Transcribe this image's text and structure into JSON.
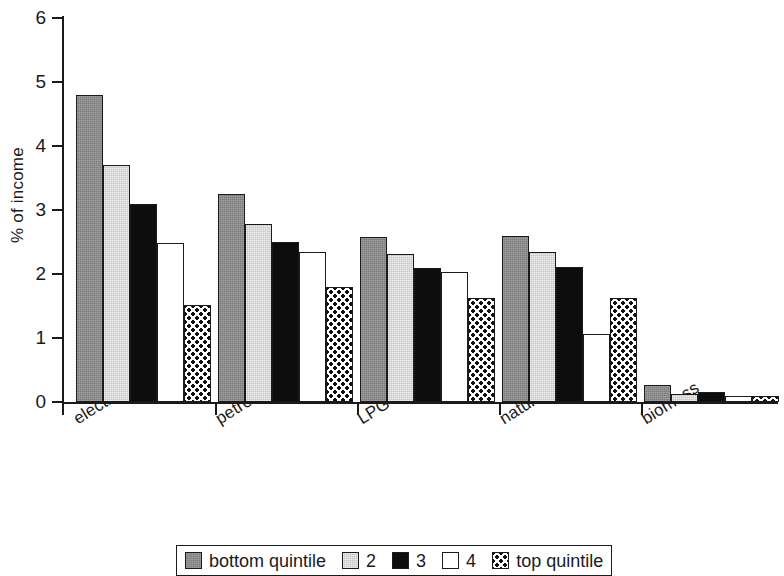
{
  "chart_data": {
    "type": "bar",
    "title": "",
    "xlabel": "",
    "ylabel": "% of income",
    "ylim": [
      0,
      6
    ],
    "ytick_values": [
      0,
      1,
      2,
      3,
      4,
      5,
      6
    ],
    "ytick_labels": [
      "0",
      "1",
      "2",
      "3",
      "4",
      "5",
      "6"
    ],
    "grid": false,
    "legend_position": "bottom",
    "categories": [
      "electricity",
      "petroleum fuels",
      "LPG",
      "natural gas",
      "biomass"
    ],
    "series": [
      {
        "name": "bottom quintile",
        "fill": "darkgray",
        "color": "#8a8a8a",
        "values": [
          4.8,
          3.25,
          2.58,
          2.59,
          0.27
        ]
      },
      {
        "name": "2",
        "fill": "lightgray",
        "color": "#d8d8d8",
        "values": [
          3.7,
          2.78,
          2.32,
          2.34,
          0.12
        ]
      },
      {
        "name": "3",
        "fill": "black",
        "color": "#0d0d0d",
        "values": [
          3.1,
          2.5,
          2.09,
          2.11,
          0.15
        ]
      },
      {
        "name": "4",
        "fill": "white",
        "color": "#ffffff",
        "values": [
          2.48,
          2.34,
          2.03,
          1.06,
          0.1
        ]
      },
      {
        "name": "top quintile",
        "fill": "dotted",
        "color": "#ffffff",
        "values": [
          1.52,
          1.8,
          1.62,
          1.63,
          0.1
        ]
      }
    ]
  },
  "legend": {
    "entries": [
      {
        "label": "bottom quintile",
        "fill": "darkgray"
      },
      {
        "label": "2",
        "fill": "lightgray"
      },
      {
        "label": "3",
        "fill": "black"
      },
      {
        "label": "4",
        "fill": "white"
      },
      {
        "label": "top quintile",
        "fill": "dotted"
      }
    ]
  }
}
